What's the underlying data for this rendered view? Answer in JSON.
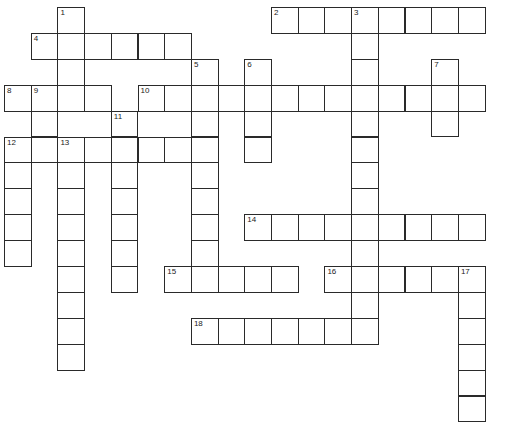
{
  "puzzle": {
    "type": "crossword",
    "cell_width": 26.7,
    "cell_height": 25.9,
    "origin_x": 4,
    "origin_y": 7,
    "colors": {
      "border": "#2a2a2a",
      "background": "#ffffff",
      "number": "#222222"
    },
    "entries": [
      {
        "number": 1,
        "direction": "down",
        "col": 2,
        "row": 0,
        "length": 4
      },
      {
        "number": 2,
        "direction": "across",
        "col": 10,
        "row": 0,
        "length": 8
      },
      {
        "number": 3,
        "direction": "down",
        "col": 13,
        "row": 0,
        "length": 13
      },
      {
        "number": 4,
        "direction": "across",
        "col": 1,
        "row": 1,
        "length": 6
      },
      {
        "number": 5,
        "direction": "down",
        "col": 7,
        "row": 2,
        "length": 9
      },
      {
        "number": 6,
        "direction": "down",
        "col": 9,
        "row": 2,
        "length": 4
      },
      {
        "number": 7,
        "direction": "down",
        "col": 16,
        "row": 2,
        "length": 3
      },
      {
        "number": 8,
        "direction": "across",
        "col": 0,
        "row": 3,
        "length": 4
      },
      {
        "number": 9,
        "direction": "down",
        "col": 1,
        "row": 3,
        "length": 3
      },
      {
        "number": 10,
        "direction": "across",
        "col": 5,
        "row": 3,
        "length": 13
      },
      {
        "number": 11,
        "direction": "down",
        "col": 4,
        "row": 4,
        "length": 7
      },
      {
        "number": 12,
        "direction": "across",
        "col": 0,
        "row": 5,
        "length": 8
      },
      {
        "number": 12,
        "direction": "down",
        "col": 0,
        "row": 5,
        "length": 5
      },
      {
        "number": 13,
        "direction": "down",
        "col": 2,
        "row": 5,
        "length": 9
      },
      {
        "number": 14,
        "direction": "across",
        "col": 9,
        "row": 8,
        "length": 9
      },
      {
        "number": 15,
        "direction": "across",
        "col": 6,
        "row": 10,
        "length": 5
      },
      {
        "number": 16,
        "direction": "across",
        "col": 12,
        "row": 10,
        "length": 6
      },
      {
        "number": 17,
        "direction": "down",
        "col": 17,
        "row": 10,
        "length": 6
      },
      {
        "number": 18,
        "direction": "across",
        "col": 7,
        "row": 12,
        "length": 7
      }
    ]
  }
}
